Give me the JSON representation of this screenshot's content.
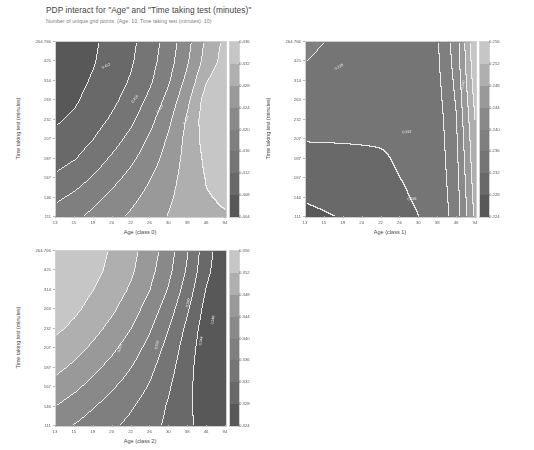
{
  "figure": {
    "title": "PDP interact for \"Age\" and \"Time taking test (minutes)\"",
    "subtitle": "Number of unique grid points: (Age: 10, Time taking test (minutes): 10)",
    "background_color": "#ffffff",
    "text_color": "#3f3f3f",
    "subtitle_color": "#7d7d7d"
  },
  "chart_data": [
    {
      "type": "heatmap",
      "name": "pdp-class-0",
      "title": "",
      "xlabel": "Age (class 0)",
      "ylabel": "Time taking test (minutes)",
      "x_ticklabels": [
        "13",
        "15",
        "19",
        "20",
        "22",
        "26",
        "30",
        "38",
        "46",
        "94"
      ],
      "y_ticklabels": [
        "264.766",
        "425",
        "314",
        "263",
        "232",
        "207",
        "187",
        "167",
        "146",
        "111"
      ],
      "xlim": [
        0,
        9
      ],
      "ylim": [
        0,
        9
      ],
      "grid": false,
      "colorbar": {
        "min": 0.404,
        "max": 0.436,
        "step": 0.004,
        "ticklabels": [
          "0.436",
          "0.432",
          "0.428",
          "0.424",
          "0.420",
          "0.416",
          "0.412",
          "0.408",
          "0.404"
        ],
        "position": "right"
      },
      "contour_labels": [
        "0.412",
        "0.416",
        "0.420",
        "0.424"
      ],
      "values": [
        [
          0.4055,
          0.4062,
          0.4075,
          0.4092,
          0.4112,
          0.414,
          0.4178,
          0.4228,
          0.4288,
          0.433
        ],
        [
          0.4058,
          0.4065,
          0.4078,
          0.4096,
          0.4116,
          0.4145,
          0.4184,
          0.4236,
          0.4296,
          0.4336
        ],
        [
          0.4062,
          0.407,
          0.4084,
          0.4102,
          0.4124,
          0.4154,
          0.4196,
          0.4252,
          0.4318,
          0.4352
        ],
        [
          0.4068,
          0.4076,
          0.4092,
          0.4112,
          0.4136,
          0.417,
          0.4214,
          0.4272,
          0.4338,
          0.4358
        ],
        [
          0.4076,
          0.4086,
          0.4104,
          0.4126,
          0.4152,
          0.4188,
          0.4232,
          0.4286,
          0.4342,
          0.4356
        ],
        [
          0.4088,
          0.41,
          0.412,
          0.4144,
          0.4172,
          0.4206,
          0.4246,
          0.4292,
          0.4336,
          0.4348
        ],
        [
          0.4104,
          0.4118,
          0.414,
          0.4166,
          0.4192,
          0.4222,
          0.4256,
          0.4294,
          0.4328,
          0.4338
        ],
        [
          0.4126,
          0.4142,
          0.4164,
          0.4188,
          0.4212,
          0.4238,
          0.4266,
          0.4296,
          0.4322,
          0.433
        ],
        [
          0.4152,
          0.4168,
          0.4188,
          0.421,
          0.423,
          0.4252,
          0.4274,
          0.4298,
          0.4318,
          0.4324
        ],
        [
          0.4178,
          0.4192,
          0.421,
          0.4228,
          0.4246,
          0.4264,
          0.4282,
          0.43,
          0.4314,
          0.4318
        ]
      ]
    },
    {
      "type": "heatmap",
      "name": "pdp-class-1",
      "title": "",
      "xlabel": "Age (class 1)",
      "ylabel": "Time taking test (minutes)",
      "x_ticklabels": [
        "13",
        "15",
        "19",
        "20",
        "22",
        "26",
        "30",
        "38",
        "46",
        "94"
      ],
      "y_ticklabels": [
        "264.766",
        "425",
        "314",
        "263",
        "232",
        "207",
        "187",
        "167",
        "146",
        "111"
      ],
      "xlim": [
        0,
        9
      ],
      "ylim": [
        0,
        9
      ],
      "grid": false,
      "colorbar": {
        "min": 0.224,
        "max": 0.256,
        "step": 0.004,
        "ticklabels": [
          "0.256",
          "0.252",
          "0.248",
          "0.244",
          "0.240",
          "0.236",
          "0.232",
          "0.228",
          "0.224"
        ],
        "position": "right"
      },
      "contour_labels": [
        "0.228",
        "0.232",
        "0.236",
        "0.240"
      ],
      "values": [
        [
          0.2362,
          0.236,
          0.2358,
          0.2356,
          0.2354,
          0.2352,
          0.2352,
          0.2356,
          0.242,
          0.2552
        ],
        [
          0.236,
          0.2358,
          0.2356,
          0.2354,
          0.2352,
          0.235,
          0.235,
          0.2354,
          0.2416,
          0.2548
        ],
        [
          0.2356,
          0.2354,
          0.2352,
          0.235,
          0.2348,
          0.2346,
          0.2346,
          0.235,
          0.241,
          0.254
        ],
        [
          0.2348,
          0.2346,
          0.2344,
          0.2342,
          0.234,
          0.2338,
          0.234,
          0.2346,
          0.2404,
          0.253
        ],
        [
          0.2336,
          0.2334,
          0.2332,
          0.233,
          0.233,
          0.233,
          0.2334,
          0.2342,
          0.2398,
          0.252
        ],
        [
          0.2322,
          0.2322,
          0.2322,
          0.2322,
          0.2322,
          0.2324,
          0.233,
          0.234,
          0.2394,
          0.2512
        ],
        [
          0.231,
          0.2312,
          0.2314,
          0.2316,
          0.2318,
          0.2322,
          0.2328,
          0.2338,
          0.239,
          0.2506
        ],
        [
          0.23,
          0.2304,
          0.2308,
          0.2312,
          0.2316,
          0.232,
          0.2326,
          0.2336,
          0.2386,
          0.25
        ],
        [
          0.2286,
          0.2292,
          0.2298,
          0.2304,
          0.231,
          0.2316,
          0.2324,
          0.2334,
          0.2382,
          0.2494
        ],
        [
          0.2268,
          0.2276,
          0.2284,
          0.2292,
          0.23,
          0.231,
          0.232,
          0.2332,
          0.2378,
          0.2488
        ]
      ]
    },
    {
      "type": "heatmap",
      "name": "pdp-class-2",
      "title": "",
      "xlabel": "Age (class 2)",
      "ylabel": "Time taking test (minutes)",
      "x_ticklabels": [
        "13",
        "15",
        "19",
        "20",
        "22",
        "26",
        "30",
        "38",
        "46",
        "94"
      ],
      "y_ticklabels": [
        "264.766",
        "425",
        "314",
        "263",
        "232",
        "207",
        "187",
        "167",
        "146",
        "111"
      ],
      "xlim": [
        0,
        9
      ],
      "ylim": [
        0,
        9
      ],
      "grid": false,
      "colorbar": {
        "min": 0.324,
        "max": 0.356,
        "step": 0.004,
        "ticklabels": [
          "0.356",
          "0.352",
          "0.348",
          "0.344",
          "0.340",
          "0.336",
          "0.332",
          "0.328",
          "0.324"
        ],
        "position": "right"
      },
      "contour_labels": [
        "0.332",
        "0.336",
        "0.340",
        "0.344",
        "0.348"
      ],
      "values": [
        [
          0.3556,
          0.3548,
          0.3534,
          0.3516,
          0.3492,
          0.346,
          0.3418,
          0.3362,
          0.3296,
          0.3252
        ],
        [
          0.3552,
          0.3544,
          0.353,
          0.351,
          0.3486,
          0.3452,
          0.341,
          0.3354,
          0.329,
          0.3248
        ],
        [
          0.3546,
          0.3536,
          0.352,
          0.35,
          0.3474,
          0.344,
          0.3396,
          0.334,
          0.3278,
          0.3242
        ],
        [
          0.3538,
          0.3526,
          0.3508,
          0.3486,
          0.3458,
          0.3422,
          0.3378,
          0.3324,
          0.3266,
          0.3238
        ],
        [
          0.3526,
          0.3512,
          0.3492,
          0.3468,
          0.344,
          0.3404,
          0.336,
          0.331,
          0.3258,
          0.3236
        ],
        [
          0.351,
          0.3494,
          0.3472,
          0.3448,
          0.342,
          0.3386,
          0.3346,
          0.33,
          0.3254,
          0.3236
        ],
        [
          0.349,
          0.3472,
          0.345,
          0.3426,
          0.34,
          0.337,
          0.3334,
          0.3294,
          0.3252,
          0.3238
        ],
        [
          0.3466,
          0.3448,
          0.3426,
          0.3404,
          0.3382,
          0.3356,
          0.3324,
          0.329,
          0.3254,
          0.3242
        ],
        [
          0.344,
          0.3422,
          0.3402,
          0.3384,
          0.3364,
          0.3342,
          0.3316,
          0.3288,
          0.3258,
          0.3248
        ],
        [
          0.3414,
          0.3398,
          0.3382,
          0.3366,
          0.335,
          0.3332,
          0.3312,
          0.3288,
          0.3264,
          0.3254
        ]
      ]
    }
  ]
}
